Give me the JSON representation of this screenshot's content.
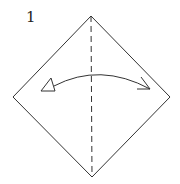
{
  "diagram": {
    "step_number": "1",
    "colors": {
      "line": "#333333",
      "background": "#ffffff"
    },
    "square": {
      "top": [
        91,
        16
      ],
      "right": [
        170,
        97
      ],
      "bottom": [
        92,
        177
      ],
      "left": [
        13,
        97
      ]
    },
    "fold_line": {
      "type": "valley-fold-dashed",
      "from": [
        91,
        16
      ],
      "to": [
        92,
        177
      ]
    },
    "arrow": {
      "type": "fold-and-unfold",
      "start": [
        54,
        86
      ],
      "end": [
        150,
        89
      ]
    }
  }
}
